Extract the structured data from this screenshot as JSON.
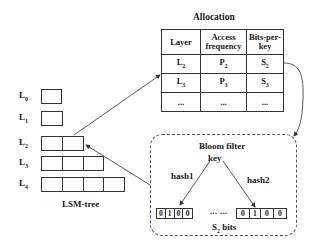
{
  "allocation": {
    "title": "Allocation",
    "headers": [
      "Layer",
      "Access frequency",
      "Bits-per-key"
    ],
    "header_lines": [
      [
        "Layer"
      ],
      [
        "Access",
        "frequency"
      ],
      [
        "Bits-per-",
        "key"
      ]
    ],
    "rows": [
      {
        "layer": "L",
        "layer_sub": "2",
        "freq": "P",
        "freq_sub": "2",
        "bits": "S",
        "bits_sub": "2"
      },
      {
        "layer": "L",
        "layer_sub": "3",
        "freq": "P",
        "freq_sub": "3",
        "bits": "S",
        "bits_sub": "3"
      },
      {
        "layer": "...",
        "layer_sub": "",
        "freq": "...",
        "freq_sub": "",
        "bits": "...",
        "bits_sub": ""
      }
    ]
  },
  "lsm_tree": {
    "label": "LSM-tree",
    "levels": [
      {
        "name": "L",
        "sub": "0",
        "blocks": 1
      },
      {
        "name": "L",
        "sub": "1",
        "blocks": 1
      },
      {
        "name": "L",
        "sub": "2",
        "blocks": 2
      },
      {
        "name": "L",
        "sub": "3",
        "blocks": 3
      },
      {
        "name": "L",
        "sub": "4",
        "blocks": 4
      }
    ]
  },
  "bloom_filter": {
    "title": "Bloom filter",
    "key_label": "key",
    "hash1_label": "hash1",
    "hash2_label": "hash2",
    "bits_left": [
      "0",
      "1",
      "0",
      "0"
    ],
    "bits_right": [
      "0",
      "1",
      "0",
      "0"
    ],
    "ellipsis": "... ...",
    "size_label_main": "S",
    "size_label_sub": "2",
    "size_label_suffix": " bits"
  }
}
